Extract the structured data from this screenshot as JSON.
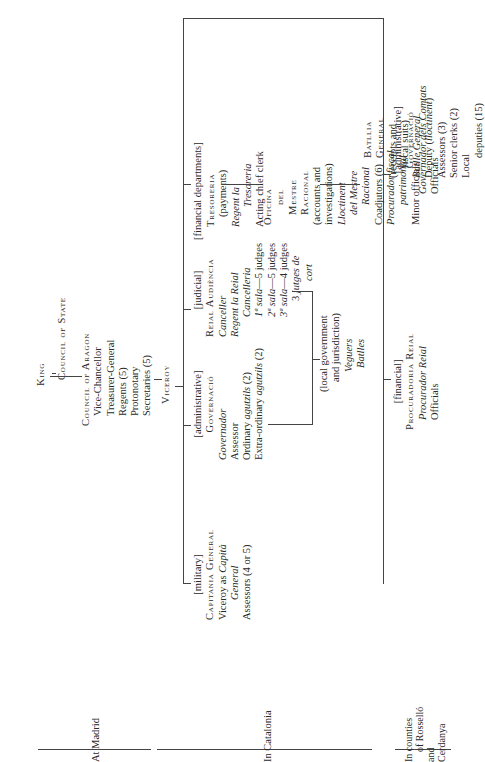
{
  "diagram": {
    "title_hint": "Organisation of royal government in Catalonia",
    "top": {
      "king": "King",
      "council_of_state": "Council of State",
      "council_of_aragon": {
        "title": "Council of Aragon",
        "members": [
          "Vice-Chancellor",
          "Treasurer-General",
          "Regents (5)",
          "Protonotary",
          "Secretaries (5)"
        ]
      },
      "viceroy": "Viceroy"
    },
    "capitania": {
      "category": "[military]",
      "title": "Capitania General",
      "lines": [
        {
          "text": "Viceroy as ",
          "italic_tail": "Capità"
        },
        {
          "text": "",
          "italic_tail": "General"
        },
        {
          "text": "Assessors (4 or 5)",
          "italic_tail": ""
        }
      ]
    },
    "governacio": {
      "category": "[administrative]",
      "title": "Governació",
      "lines": [
        {
          "text": "",
          "italic_tail": "Governador"
        },
        {
          "text": "Assessor",
          "italic_tail": ""
        },
        {
          "text": "Ordinary ",
          "italic_tail": "agutzils",
          "suffix": " (2)"
        },
        {
          "text": "Extra-ordinary ",
          "italic_tail": "agutzils",
          "suffix": " (2)"
        }
      ]
    },
    "audiencia": {
      "category": "[judicial]",
      "title": "Reial Audiència",
      "lines": [
        {
          "italic": "Canceller"
        },
        {
          "italic": "Regent la Reial"
        },
        {
          "italic": "Cancelleria"
        },
        {
          "prefix_italic": "1ª sala",
          "rest": "—5 judges"
        },
        {
          "prefix_italic": "2ª sala",
          "rest": "—5 judges"
        },
        {
          "prefix_italic": "3ª sala",
          "rest": "—4 judges"
        },
        {
          "rest": "3 ",
          "italic_tail": "jutges de"
        },
        {
          "italic": "cort"
        }
      ]
    },
    "local": {
      "lines": [
        "(local government",
        "and jurisdiction)"
      ],
      "italic_lines": [
        "Veguers",
        "Batlles"
      ]
    },
    "financial_departments_label": "[financial departments]",
    "tresoreria": {
      "title": "Tresoreria",
      "lines": [
        "(payments)"
      ],
      "italic_lines": [
        "Regent la",
        "Tresoreria"
      ],
      "tail": "Acting chief clerk"
    },
    "oficina": {
      "title_lines": [
        "Oficina",
        "del",
        "Mestre",
        "Racional"
      ],
      "lines": [
        "(accounts and",
        "investigations)"
      ],
      "italic_lines": [
        "Lloctinent",
        "del Mestre",
        "Racional"
      ],
      "coadjutors": "Coadjutors (6)",
      "procurador": [
        "Procurador fiscal",
        "patrimonial"
      ],
      "minor": "Minor officials"
    },
    "batllia": {
      "title_lines": [
        "Batllia",
        "General"
      ],
      "lines": [
        "(receipts and",
        "fiscal suits)"
      ],
      "italic_line": "Batlle General",
      "deputy": "Deputy (",
      "deputy_italic": "lloctinent",
      "deputy_end": ")",
      "more": [
        "Assessors (3)",
        "Senior clerks (2)",
        "Local",
        "deputies (15)"
      ]
    },
    "procuradoria": {
      "category": "[financial]",
      "title": "Procuradoria Reial",
      "italic": "Procurador Reial",
      "officials": "Officials"
    },
    "governacio_comtats": {
      "category": "[administrative]",
      "title": "Governació",
      "italic": "Governador dels Comtats",
      "officials": "Officials"
    },
    "regions": {
      "madrid": "At Madrid",
      "catalonia": "In Catalonia",
      "rossello": [
        "In counties",
        "of Rosselló",
        "and",
        "Cerdanya"
      ]
    }
  }
}
